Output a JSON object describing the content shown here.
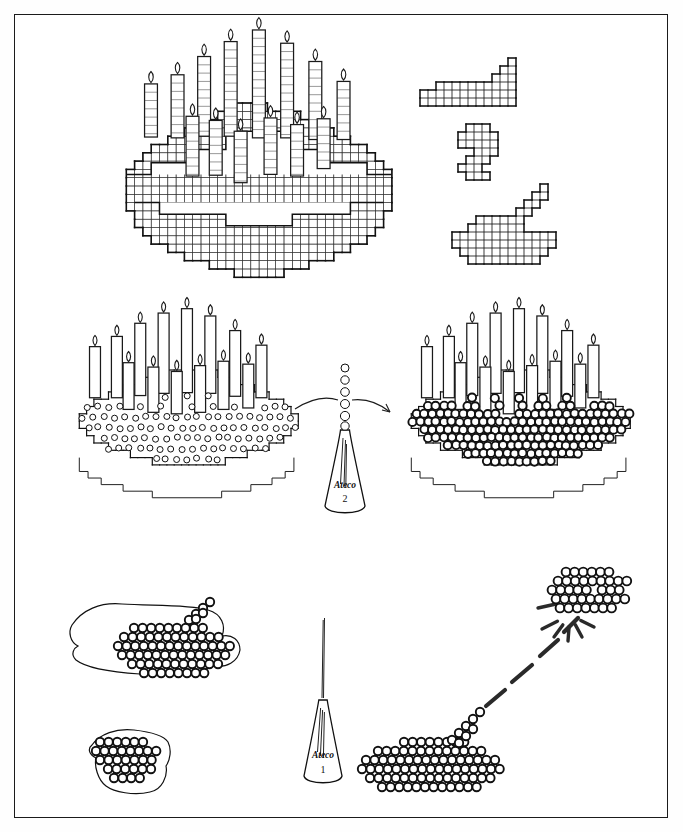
{
  "page": {
    "background_color": "#ffffff",
    "ink_color": "#1d1d1d",
    "frame": {
      "x": 14,
      "y": 14,
      "width": 654,
      "height": 804,
      "stroke": "#1b1b1b"
    }
  },
  "panels": [
    {
      "id": "panel-top-left",
      "name": "grid-cake-template",
      "caption": "",
      "description": "Graph-paper cake outline with eleven candles drawn over a square grid",
      "candle_count": 11,
      "cell_size": 8.2,
      "origin": {
        "x": 120,
        "y": 100
      }
    },
    {
      "id": "panel-top-right",
      "name": "grid-detail-shapes",
      "caption": "",
      "shapes": [
        {
          "name": "grid-shape-step",
          "origin": {
            "x": 412,
            "y": 58
          }
        },
        {
          "name": "grid-shape-spiral",
          "origin": {
            "x": 456,
            "y": 126
          }
        },
        {
          "name": "grid-shape-tail",
          "origin": {
            "x": 458,
            "y": 188
          }
        }
      ]
    },
    {
      "id": "panel-mid-left",
      "name": "cake-piped-fine-dots",
      "caption": "",
      "dot_style": "fine",
      "candle_count": 11,
      "origin": {
        "x": 70,
        "y": 318
      }
    },
    {
      "id": "panel-mid-center",
      "name": "piping-tip-two",
      "caption": "",
      "tip_brand": "Ateco",
      "tip_number": "2",
      "bead_count": 6,
      "origin": {
        "x": 322,
        "y": 350
      }
    },
    {
      "id": "panel-mid-right",
      "name": "cake-piped-pearl-dots",
      "caption": "",
      "dot_style": "pearl",
      "candle_count": 11,
      "origin": {
        "x": 392,
        "y": 320
      }
    },
    {
      "id": "panel-bottom-left",
      "name": "parchment-practice-sheets",
      "caption": "",
      "sheets": [
        {
          "name": "parchment-sheet-large",
          "origin": {
            "x": 62,
            "y": 600
          }
        },
        {
          "name": "parchment-sheet-small",
          "origin": {
            "x": 80,
            "y": 720
          }
        }
      ]
    },
    {
      "id": "panel-bottom-center",
      "name": "piping-tip-one",
      "caption": "",
      "tip_brand": "Ateco",
      "tip_number": "1",
      "origin": {
        "x": 300,
        "y": 620
      }
    },
    {
      "id": "panel-bottom-right",
      "name": "dot-cluster-magnified",
      "caption": "",
      "callout": "magnification-burst",
      "burst_ray_count": 5,
      "origin": {
        "x": 360,
        "y": 700
      }
    }
  ],
  "tips": {
    "upper": {
      "brand": "Ateco",
      "number": "2"
    },
    "lower": {
      "brand": "Ateco",
      "number": "1"
    }
  },
  "colors": {
    "paper": "#ffffff",
    "ink": "#1d1d1d",
    "grid": "#333333",
    "accent": "#2a2a2a"
  }
}
